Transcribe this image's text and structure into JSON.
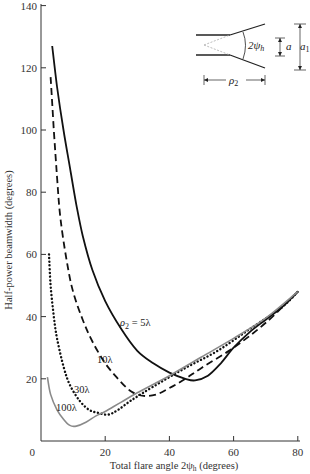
{
  "chart_data": {
    "type": "line",
    "title": "",
    "xlabel": "Total flare angle 2ψh (degrees)",
    "ylabel": "Half-power beamwidth (degrees)",
    "xlim": [
      0,
      80
    ],
    "ylim": [
      0,
      140
    ],
    "xticks": [
      0,
      20,
      40,
      60,
      80
    ],
    "yticks": [
      0,
      20,
      40,
      60,
      80,
      100,
      120,
      140
    ],
    "grid": false,
    "legend": "inline curve labels",
    "series": [
      {
        "name": "ρ2 = 5λ",
        "style": "solid",
        "color": "#111111",
        "points": [
          [
            3.5,
            127
          ],
          [
            5,
            114
          ],
          [
            7,
            100
          ],
          [
            9,
            88
          ],
          [
            11,
            76
          ],
          [
            13,
            66
          ],
          [
            16,
            55
          ],
          [
            20,
            45
          ],
          [
            25,
            36
          ],
          [
            30,
            29
          ],
          [
            35,
            25
          ],
          [
            40,
            22
          ],
          [
            45,
            20
          ],
          [
            48,
            19.5
          ],
          [
            52,
            21
          ],
          [
            56,
            25
          ],
          [
            60,
            30
          ],
          [
            65,
            35
          ],
          [
            70,
            39
          ],
          [
            75,
            43
          ],
          [
            80,
            48
          ]
        ]
      },
      {
        "name": "10λ",
        "style": "dashed",
        "color": "#111111",
        "points": [
          [
            3,
            117
          ],
          [
            4,
            100
          ],
          [
            5,
            85
          ],
          [
            6,
            72
          ],
          [
            8,
            58
          ],
          [
            10,
            48
          ],
          [
            13,
            39
          ],
          [
            16,
            32
          ],
          [
            20,
            25
          ],
          [
            24,
            20
          ],
          [
            28,
            16
          ],
          [
            32,
            14.5
          ],
          [
            36,
            15
          ],
          [
            40,
            17
          ],
          [
            45,
            20
          ],
          [
            50,
            23.5
          ],
          [
            60,
            30
          ],
          [
            70,
            38
          ],
          [
            80,
            48
          ]
        ]
      },
      {
        "name": "30λ",
        "style": "dotted",
        "color": "#111111",
        "points": [
          [
            2.5,
            60
          ],
          [
            3,
            50
          ],
          [
            4,
            40
          ],
          [
            5,
            33
          ],
          [
            7,
            24
          ],
          [
            9,
            18
          ],
          [
            12,
            13
          ],
          [
            15,
            10
          ],
          [
            18,
            9
          ],
          [
            21,
            8.5
          ],
          [
            24,
            10
          ],
          [
            28,
            13
          ],
          [
            35,
            17.5
          ],
          [
            45,
            23.5
          ],
          [
            55,
            29
          ],
          [
            65,
            36
          ],
          [
            75,
            43
          ],
          [
            80,
            48
          ]
        ]
      },
      {
        "name": "100λ",
        "style": "solid-gray",
        "color": "#8a8a8a",
        "points": [
          [
            2,
            20.5
          ],
          [
            3,
            15
          ],
          [
            5,
            10
          ],
          [
            7,
            7
          ],
          [
            9,
            5
          ],
          [
            11,
            4.8
          ],
          [
            14,
            6
          ],
          [
            17,
            8
          ],
          [
            20,
            9.5
          ],
          [
            25,
            12.5
          ],
          [
            30,
            15.5
          ],
          [
            40,
            21
          ],
          [
            50,
            27
          ],
          [
            60,
            33
          ],
          [
            70,
            39.5
          ],
          [
            80,
            48
          ]
        ]
      }
    ],
    "annotations": [
      {
        "text": "ρ2 = 5λ",
        "x_px": 120,
        "y_px": 326
      },
      {
        "text": "10λ",
        "x_px": 97,
        "y_px": 363
      },
      {
        "text": "30λ",
        "x_px": 74,
        "y_px": 393
      },
      {
        "text": "100λ",
        "x_px": 56,
        "y_px": 411
      }
    ],
    "inset": {
      "labels": {
        "angle": "2ψh",
        "a": "a",
        "a1": "a1",
        "rho2": "ρ2"
      }
    }
  },
  "labels": {
    "xlabel": "Total flare angle 2ψ",
    "xlabel_sub": "h",
    "xlabel_tail": " (degrees)",
    "ylabel": "Half-power beamwidth (degrees)",
    "c5_rho": "ρ",
    "c5_sub": "2",
    "c5_tail": " = 5λ",
    "c10": "10λ",
    "c30": "30λ",
    "c100": "100λ",
    "inset_angle": "2ψ",
    "inset_angle_sub": "h",
    "inset_a": "a",
    "inset_a1": "a",
    "inset_a1_sub": "1",
    "inset_rho": "ρ",
    "inset_rho_sub": "2"
  }
}
